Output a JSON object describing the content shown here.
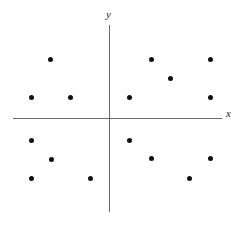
{
  "figure": {
    "title": "",
    "background_color": "#ffffff",
    "width": 244,
    "height": 226
  },
  "axes": {
    "x_label": "x",
    "y_label": "y",
    "axis_color": "#6b6b6b",
    "origin_px": {
      "x": 109,
      "y": 118
    },
    "x_axis_px": {
      "start_x": 13,
      "end_x": 222,
      "y": 118
    },
    "y_axis_px": {
      "x": 109,
      "start_y": 25,
      "end_y": 212
    }
  },
  "chart_data": {
    "type": "scatter",
    "title": "",
    "xlabel": "x",
    "ylabel": "y",
    "grid": false,
    "legend": null,
    "axis_style": "cartesian-cross-no-ticks",
    "marker": {
      "shape": "circle",
      "color": "#101010",
      "size_px": 5
    },
    "point_count": 16,
    "xlim_px": [
      13,
      222
    ],
    "ylim_px": [
      25,
      212
    ],
    "points_px": [
      {
        "x": 50,
        "y": 59,
        "quadrant": "II"
      },
      {
        "x": 31,
        "y": 97,
        "quadrant": "II"
      },
      {
        "x": 70,
        "y": 97,
        "quadrant": "II"
      },
      {
        "x": 151,
        "y": 59,
        "quadrant": "I"
      },
      {
        "x": 210,
        "y": 59,
        "quadrant": "I"
      },
      {
        "x": 170,
        "y": 78,
        "quadrant": "I"
      },
      {
        "x": 129,
        "y": 97,
        "quadrant": "I"
      },
      {
        "x": 210,
        "y": 97,
        "quadrant": "I"
      },
      {
        "x": 31,
        "y": 140,
        "quadrant": "III"
      },
      {
        "x": 51,
        "y": 159,
        "quadrant": "III"
      },
      {
        "x": 31,
        "y": 178,
        "quadrant": "III"
      },
      {
        "x": 90,
        "y": 178,
        "quadrant": "III"
      },
      {
        "x": 129,
        "y": 140,
        "quadrant": "IV"
      },
      {
        "x": 151,
        "y": 158,
        "quadrant": "IV"
      },
      {
        "x": 210,
        "y": 158,
        "quadrant": "IV"
      },
      {
        "x": 189,
        "y": 178,
        "quadrant": "IV"
      }
    ],
    "points_data": [
      {
        "x": -3,
        "y": 3
      },
      {
        "x": -4,
        "y": 1
      },
      {
        "x": -2,
        "y": 1
      },
      {
        "x": 2,
        "y": 3
      },
      {
        "x": 5,
        "y": 3
      },
      {
        "x": 3,
        "y": 2
      },
      {
        "x": 1,
        "y": 1
      },
      {
        "x": 5,
        "y": 1
      },
      {
        "x": -4,
        "y": -1
      },
      {
        "x": -3,
        "y": -2
      },
      {
        "x": -4,
        "y": -3
      },
      {
        "x": -1,
        "y": -3
      },
      {
        "x": 1,
        "y": -1
      },
      {
        "x": 2,
        "y": -2
      },
      {
        "x": 5,
        "y": -2
      },
      {
        "x": 4,
        "y": -3
      }
    ]
  }
}
